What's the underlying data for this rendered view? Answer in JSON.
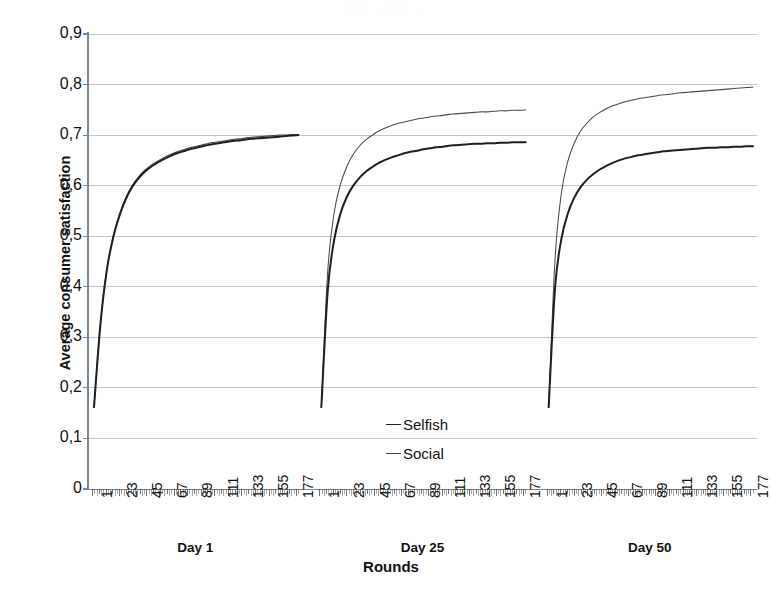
{
  "chart_data": {
    "type": "line",
    "title": "",
    "xlabel": "Rounds",
    "ylabel": "Average consumer satisfaction",
    "ylim": [
      0,
      0.9
    ],
    "y_ticks": [
      "0",
      "0,1",
      "0,2",
      "0,3",
      "0,4",
      "0,5",
      "0,6",
      "0,7",
      "0,8",
      "0,9"
    ],
    "y_tick_values": [
      0,
      0.1,
      0.2,
      0.3,
      0.4,
      0.5,
      0.6,
      0.7,
      0.8,
      0.9
    ],
    "x_ticks": [
      "1",
      "23",
      "45",
      "67",
      "89",
      "111",
      "133",
      "155",
      "177"
    ],
    "x_tick_values": [
      1,
      23,
      45,
      67,
      89,
      111,
      133,
      155,
      177
    ],
    "x_range": [
      1,
      180
    ],
    "grid": "horizontal",
    "legend_position": "center",
    "panels": [
      {
        "caption": "Day 1",
        "series": [
          {
            "name": "Selfish",
            "start": 0.162,
            "end": 0.7,
            "values": [
              0.162,
              0.325,
              0.432,
              0.497,
              0.541,
              0.574,
              0.598,
              0.615,
              0.628,
              0.638,
              0.646,
              0.653,
              0.659,
              0.664,
              0.668,
              0.672,
              0.675,
              0.678,
              0.681,
              0.683,
              0.685,
              0.687,
              0.689,
              0.69,
              0.692,
              0.693,
              0.694,
              0.695,
              0.696,
              0.697,
              0.698,
              0.699,
              0.7
            ]
          },
          {
            "name": "Social",
            "start": 0.162,
            "end": 0.701,
            "values": [
              0.162,
              0.327,
              0.435,
              0.5,
              0.544,
              0.577,
              0.601,
              0.618,
              0.631,
              0.641,
              0.649,
              0.656,
              0.662,
              0.667,
              0.671,
              0.675,
              0.678,
              0.681,
              0.684,
              0.686,
              0.688,
              0.69,
              0.692,
              0.693,
              0.695,
              0.696,
              0.697,
              0.698,
              0.699,
              0.7,
              0.7,
              0.701,
              0.701
            ]
          }
        ]
      },
      {
        "caption": "Day 25",
        "series": [
          {
            "name": "Selfish",
            "start": 0.162,
            "end": 0.686,
            "values": [
              0.162,
              0.392,
              0.492,
              0.545,
              0.578,
              0.6,
              0.616,
              0.628,
              0.637,
              0.645,
              0.651,
              0.656,
              0.66,
              0.664,
              0.667,
              0.669,
              0.672,
              0.674,
              0.676,
              0.677,
              0.679,
              0.68,
              0.681,
              0.682,
              0.683,
              0.683,
              0.684,
              0.684,
              0.685,
              0.685,
              0.686,
              0.686,
              0.686
            ]
          },
          {
            "name": "Social",
            "start": 0.162,
            "end": 0.75,
            "values": [
              0.162,
              0.43,
              0.546,
              0.603,
              0.638,
              0.662,
              0.679,
              0.691,
              0.7,
              0.708,
              0.714,
              0.719,
              0.723,
              0.726,
              0.729,
              0.732,
              0.734,
              0.736,
              0.738,
              0.739,
              0.741,
              0.742,
              0.743,
              0.744,
              0.745,
              0.746,
              0.746,
              0.747,
              0.748,
              0.748,
              0.749,
              0.749,
              0.75
            ]
          }
        ]
      },
      {
        "caption": "Day 50",
        "series": [
          {
            "name": "Selfish",
            "start": 0.162,
            "end": 0.678,
            "values": [
              0.162,
              0.398,
              0.495,
              0.545,
              0.576,
              0.597,
              0.612,
              0.623,
              0.632,
              0.639,
              0.645,
              0.65,
              0.654,
              0.657,
              0.66,
              0.662,
              0.664,
              0.666,
              0.668,
              0.669,
              0.67,
              0.671,
              0.672,
              0.673,
              0.674,
              0.675,
              0.675,
              0.676,
              0.676,
              0.677,
              0.677,
              0.678,
              0.678
            ]
          },
          {
            "name": "Social",
            "start": 0.162,
            "end": 0.795,
            "values": [
              0.162,
              0.455,
              0.586,
              0.648,
              0.684,
              0.708,
              0.724,
              0.736,
              0.745,
              0.752,
              0.758,
              0.762,
              0.766,
              0.769,
              0.772,
              0.774,
              0.776,
              0.778,
              0.78,
              0.781,
              0.783,
              0.784,
              0.785,
              0.786,
              0.787,
              0.788,
              0.789,
              0.79,
              0.791,
              0.792,
              0.793,
              0.794,
              0.795
            ]
          }
        ]
      }
    ],
    "legend": [
      {
        "label": "Selfish",
        "style": "thick"
      },
      {
        "label": "Social",
        "style": "thin"
      }
    ],
    "colors": {
      "selfish_line": "#1f1f1f",
      "social_line": "#4a4a4a",
      "gridline": "#b9bfc9",
      "axis": "#7d8590",
      "text": "#111111",
      "background": "#ffffff"
    }
  },
  "scan_artifact": {
    "top_bleed_text": "·   ·    ·     ·      ·       ·        ·         ·"
  }
}
